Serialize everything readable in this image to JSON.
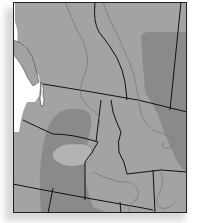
{
  "map": {
    "colors": {
      "land": "#a3a3a3",
      "range": "#8a8a8a",
      "water": "#ffffff",
      "border": "#111111",
      "river": "#7a7a7a",
      "lake": "#b3b3b3",
      "frame": "#222222",
      "shadow": "#d8d8d8"
    },
    "regions": [
      "British Columbia",
      "Alberta",
      "Washington",
      "Oregon",
      "Idaho",
      "Montana",
      "Wyoming"
    ],
    "layers": [
      "land",
      "shaded-range",
      "state-borders",
      "rivers",
      "coastline"
    ]
  }
}
